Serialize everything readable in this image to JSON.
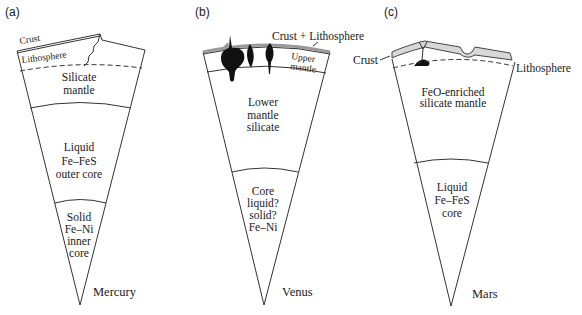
{
  "figure": {
    "panels": [
      {
        "id": "a",
        "label": "(a)",
        "planet": "Mercury",
        "layers": {
          "crust": "Crust",
          "lithosphere": "Lithosphere",
          "mantle": [
            "Silicate",
            "mantle"
          ],
          "outer_core": [
            "Liquid",
            "Fe–FeS",
            "outer core"
          ],
          "inner_core": [
            "Solid",
            "Fe–Ni",
            "inner",
            "core"
          ]
        }
      },
      {
        "id": "b",
        "label": "(b)",
        "planet": "Venus",
        "layers": {
          "crust_lithosphere": "Crust + Lithosphere",
          "upper_mantle": [
            "Upper",
            "mantle"
          ],
          "lower_mantle": [
            "Lower",
            "mantle",
            "silicate"
          ],
          "core": [
            "Core",
            "liquid?",
            "solid?",
            "Fe–Ni"
          ]
        }
      },
      {
        "id": "c",
        "label": "(c)",
        "planet": "Mars",
        "layers": {
          "crust": "Crust",
          "lithosphere": "Lithosphere",
          "mantle": [
            "FeO-enriched",
            "silicate mantle"
          ],
          "core": [
            "Liquid",
            "Fe–FeS",
            "core"
          ]
        }
      }
    ],
    "colors": {
      "line": "#333333",
      "crust_fill": "#d8d8d8",
      "plume_fill": "#111111",
      "background": "#ffffff"
    }
  }
}
